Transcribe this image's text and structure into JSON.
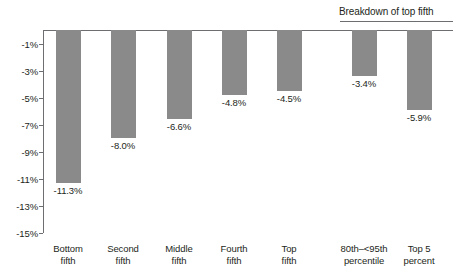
{
  "chart_data": {
    "type": "bar",
    "title": "",
    "subtitle": "",
    "xlabel": "",
    "ylabel": "",
    "categories": [
      "Bottom fifth",
      "Second fifth",
      "Middle fifth",
      "Fourth fifth",
      "Top fifth",
      "80th–<95th percentile",
      "Top 5 percent"
    ],
    "category_lines": [
      [
        "Bottom",
        "fifth"
      ],
      [
        "Second",
        "fifth"
      ],
      [
        "Middle",
        "fifth"
      ],
      [
        "Fourth",
        "fifth"
      ],
      [
        "Top",
        "fifth"
      ],
      [
        "80th–<95th",
        "percentile"
      ],
      [
        "Top 5",
        "percent"
      ]
    ],
    "values": [
      -11.3,
      -8.0,
      -6.6,
      -4.8,
      -4.5,
      -3.4,
      -5.9
    ],
    "value_labels": [
      "-11.3%",
      "-8.0%",
      "-6.6%",
      "-4.8%",
      "-4.5%",
      "-3.4%",
      "-5.9%"
    ],
    "ylim": [
      -15,
      0
    ],
    "ytick_values": [
      -1,
      -3,
      -5,
      -7,
      -9,
      -11,
      -13,
      -15
    ],
    "ytick_labels": [
      "-1%",
      "-3%",
      "-5%",
      "-7%",
      "-9%",
      "-11%",
      "-13%",
      "-15%"
    ],
    "grid": false,
    "legend": false,
    "bar_color": "#8a8a8a",
    "axis_color": "#6d6e71",
    "text_color": "#231f20",
    "annotations": [
      {
        "name": "breakdown-of-top-fifth",
        "text": "Breakdown of top fifth",
        "covers_categories": [
          "80th–<95th percentile",
          "Top 5 percent"
        ]
      }
    ]
  }
}
